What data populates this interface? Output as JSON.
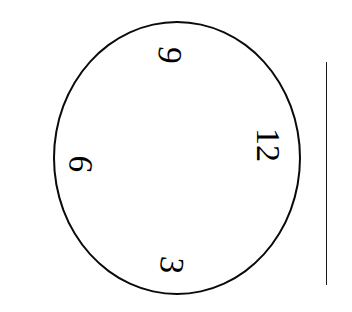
{
  "figure": {
    "kind": "clock-face-diagram",
    "background_color": "#ffffff",
    "stroke_color": "#0a0a0a",
    "dial": {
      "shape": "circle",
      "center_x": 177,
      "center_y": 158,
      "radius_x": 124,
      "radius_y": 137,
      "stroke_width": 2
    },
    "numerals": [
      {
        "label": "12",
        "position": "right",
        "rotation_degrees": 90
      },
      {
        "label": "3",
        "position": "bottom",
        "rotation_degrees": 96
      },
      {
        "label": "6",
        "position": "left",
        "rotation_degrees": 96
      },
      {
        "label": "9",
        "position": "top",
        "rotation_degrees": 96
      }
    ],
    "side_rule": {
      "orientation": "vertical",
      "x": 326,
      "y_start": 62,
      "y_end": 285,
      "stroke_width": 1,
      "color": "#1a1a1a"
    }
  }
}
